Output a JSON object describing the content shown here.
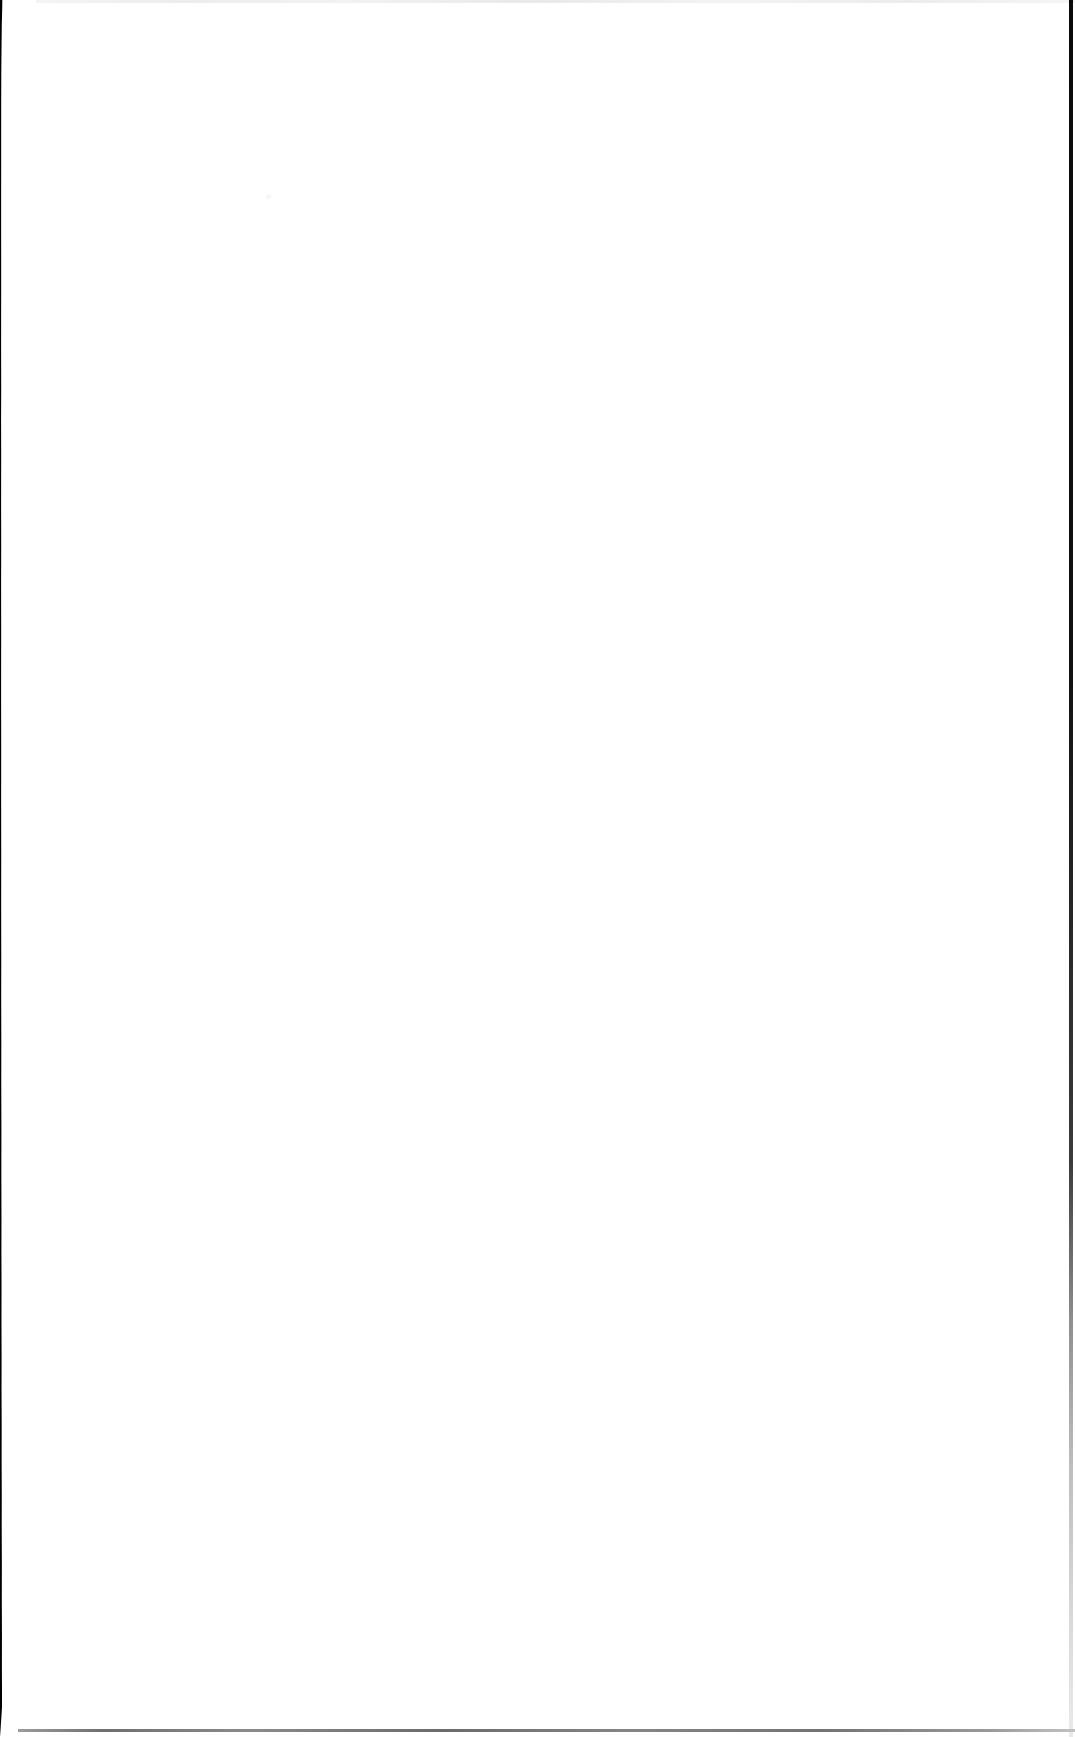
{
  "document": {
    "kind": "scanned-page",
    "page_label": "",
    "body_text": "",
    "has_visible_text": false,
    "note": ""
  },
  "page": {
    "width_px": 1075,
    "height_px": 1737,
    "paper_color": "#ffffff",
    "orientation": "portrait"
  },
  "artifacts": {
    "left_shadow": {
      "label": "",
      "color": "#000000",
      "top_width_px": 42,
      "mid_width_px": 21,
      "bottom_width_px": 36
    },
    "right_edge": {
      "label": "",
      "color_top": "#0a0a0a",
      "color_bottom": "#eaeaea",
      "width_px": 4
    },
    "top_hairline": {
      "label": "",
      "color": "#eeeeee",
      "height_px": 3
    },
    "bottom_hairline": {
      "label": "",
      "color": "#7a7a7a",
      "height_px": 3
    },
    "speck": {
      "label": "",
      "color": "#f7f7f8"
    }
  }
}
